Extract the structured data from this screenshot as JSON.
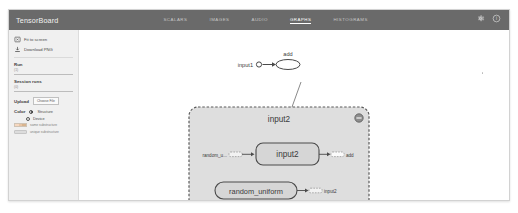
{
  "app": {
    "brand": "TensorBoard"
  },
  "tabs": [
    {
      "label": "SCALARS",
      "active": false
    },
    {
      "label": "IMAGES",
      "active": false
    },
    {
      "label": "AUDIO",
      "active": false
    },
    {
      "label": "GRAPHS",
      "active": true
    },
    {
      "label": "HISTOGRAMS",
      "active": false
    }
  ],
  "topbar_icons": [
    {
      "name": "gear-icon"
    },
    {
      "name": "help-icon"
    }
  ],
  "sidebar": {
    "actions": [
      {
        "icon": "fit-to-screen-icon",
        "label": "Fit to screen"
      },
      {
        "icon": "download-icon",
        "label": "Download PNG"
      }
    ],
    "run": {
      "label": "Run",
      "count": "(1)",
      "value": ""
    },
    "session_runs": {
      "label": "Session runs",
      "count": "(0)",
      "value": ""
    },
    "upload": {
      "label": "Upload",
      "button": "Choose File"
    },
    "color": {
      "label": "Color",
      "options": [
        {
          "label": "Structure",
          "selected": true
        },
        {
          "label": "Device",
          "selected": false
        }
      ]
    },
    "legend": [
      {
        "swatch": "multicolor",
        "text": "same substructure"
      },
      {
        "swatch": "gray",
        "text": "unique substructure"
      }
    ]
  },
  "graph": {
    "top_nodes": {
      "input1_label": "input1",
      "add_label": "add"
    },
    "group": {
      "title": "input2",
      "collapse_icon": "minus-circle-icon",
      "row1": {
        "source_label": "random_u...",
        "node_label": "input2",
        "target_label": "add"
      },
      "row2": {
        "node_label": "random_uniform",
        "target_label": "input2"
      }
    }
  },
  "colors": {
    "topbar": "#6a6a6a",
    "sidebar": "#f0f0f0",
    "canvas": "#ffffff",
    "group_fill": "#dedede",
    "node_fill": "#d6d6d6",
    "stroke": "#5a5a5a"
  }
}
